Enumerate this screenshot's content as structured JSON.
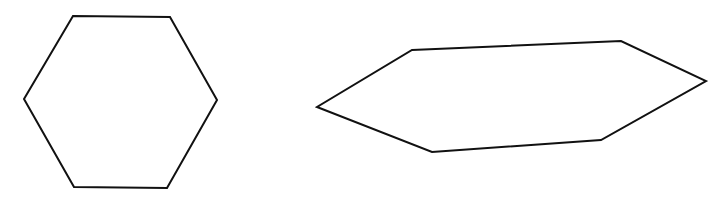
{
  "canvas": {
    "width": 721,
    "height": 203,
    "background": "#ffffff"
  },
  "shapes": [
    {
      "name": "regular-hexagon",
      "type": "hexagon",
      "stroke": "#111111",
      "stroke_width": 2,
      "points": "73,16 170,17 217,100 167,188 74,187 24,99"
    },
    {
      "name": "flattened-hexagon",
      "type": "hexagon",
      "stroke": "#111111",
      "stroke_width": 2,
      "points": "412,50 621,41 706,81 601,140 432,152 317,107"
    }
  ]
}
